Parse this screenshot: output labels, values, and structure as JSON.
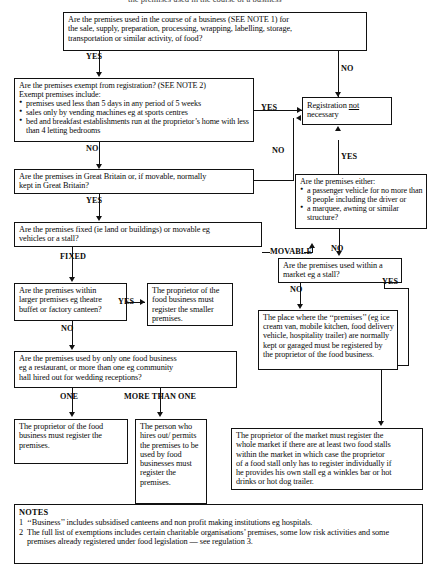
{
  "document": {
    "title_fragment": "the premises used in the course of a business",
    "notes_heading": "NOTES",
    "notes": [
      {
        "num": "1",
        "text": "‘‘Business’’ includes subsidised canteens and non profit making institutions eg hospitals."
      },
      {
        "num": "2",
        "text": "The full list of exemptions includes certain charitable organisations’ premises, some low risk activities and some premises already registered under food legislation — see regulation 3."
      }
    ]
  },
  "nodes": {
    "q_business": {
      "line1": "Are the premises used in the course of a business (SEE NOTE 1) for",
      "line2": "the sale, supply, preparation, processing, wrapping, labelling, storage,",
      "line3": "transportation or similar activity, of food?"
    },
    "q_exempt": {
      "line1": "Are the premises exempt from registration? (SEE NOTE 2)",
      "line2": "Exempt premises include:",
      "bullet1": "premises used less than 5 days in any period of 5 weeks",
      "bullet2": "sales only by vending machines eg at sports centres",
      "bullet3": "bed and breakfast establishments run at the proprietor’s home with less than 4 letting bedrooms"
    },
    "registration_not_necessary": {
      "pre": "Registration ",
      "emph": "not",
      "post": " necessary"
    },
    "q_great_britain": {
      "line1": "Are the premises in Great Britain or, if movable, normally",
      "line2": "kept in Great Britain?"
    },
    "q_vehicle": {
      "line1": "Are the premises either:",
      "bullet1": "a passenger vehicle for no more than 8 people including the driver or",
      "bullet2": "a marquee, awning or similar structure?"
    },
    "q_fixed": {
      "line1": "Are the premises fixed (ie land or buildings) or movable eg",
      "line2": "vehicles or a stall?"
    },
    "q_market": {
      "line1": "Are the premises used within a",
      "line2": "market eg a stall?"
    },
    "q_larger": {
      "line1": "Are the premises within",
      "line2": "larger premises eg theatre",
      "line3": "buffet or factory canteen?"
    },
    "a_smaller_premises": {
      "text": "The proprietor of the food business must register the smaller premises."
    },
    "a_garaged": {
      "text": "The place where the ‘‘premises’’ (eg ice cream van, mobile kitchen, food delivery vehicle, hospitality trailer) are normally kept or garaged must be registered by the proprietor of the food business."
    },
    "q_one_or_more": {
      "line1": "Are the premises used by only one food business",
      "line2": "eg a restaurant, or more than one eg community",
      "line3": "hall hired out for wedding receptions?"
    },
    "a_proprietor_register": {
      "text": "The proprietor of the food business must register the premises."
    },
    "a_hirer_register": {
      "text": "The person who hires out/ permits the premises to be used by food businesses must register the premises."
    },
    "a_market_proprietor": {
      "line1": "The proprietor of the market must register the",
      "line2": "whole market if there are at least two food stalls",
      "line3": "within the market in which case the proprietor",
      "line4": "of a food stall only has to register individually if",
      "line5": "he provides his own stall eg a winkles bar or hot",
      "line6": "drinks or hot dog trailer."
    }
  },
  "edges": {
    "yes_business": "YES",
    "no_business": "NO",
    "yes_exempt": "YES",
    "no_exempt": "NO",
    "no_gb": "NO",
    "yes_vehicle": "YES",
    "no_vehicle": "NO",
    "yes_gb": "YES",
    "movable": "MOVABLE",
    "fixed": "FIXED",
    "yes_larger": "YES",
    "no_larger": "NO",
    "no_market": "NO",
    "yes_market": "YES",
    "one": "ONE",
    "more_than_one": "MORE THAN ONE"
  }
}
